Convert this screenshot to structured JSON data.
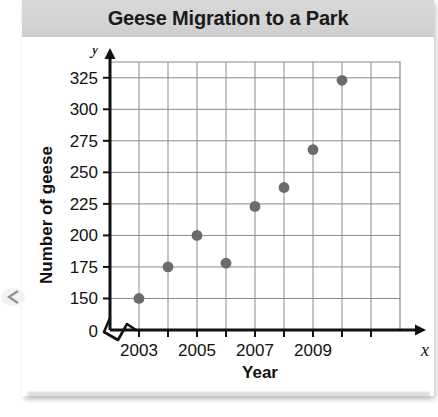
{
  "chart_data": {
    "type": "scatter",
    "title": "Geese Migration to a Park",
    "xlabel": "Year",
    "ylabel": "Number of geese",
    "x": [
      2003,
      2004,
      2005,
      2006,
      2007,
      2008,
      2009,
      2010
    ],
    "values": [
      150,
      175,
      200,
      178,
      223,
      238,
      268,
      323
    ],
    "xlim": [
      2002,
      2012
    ],
    "ylim": [
      125,
      337.5
    ],
    "ytick_labels": [
      "0",
      "150",
      "175",
      "200",
      "225",
      "250",
      "275",
      "300",
      "325"
    ],
    "ytick_values": [
      125,
      150,
      175,
      200,
      225,
      250,
      275,
      300,
      325
    ],
    "xtick_values": [
      2003,
      2004,
      2005,
      2006,
      2007,
      2008,
      2009,
      2010,
      2011
    ],
    "xtick_labels": [
      "2003",
      "",
      "2005",
      "",
      "2007",
      "",
      "2009",
      "",
      ""
    ],
    "y_axis_symbol": "y",
    "x_axis_symbol": "x",
    "grid": true,
    "legend": "none",
    "axis_break": "zigzag-at-origin",
    "point_color": "#6b6b6b",
    "grid_color": "#8a8a8a",
    "axis_color": "#111111"
  }
}
